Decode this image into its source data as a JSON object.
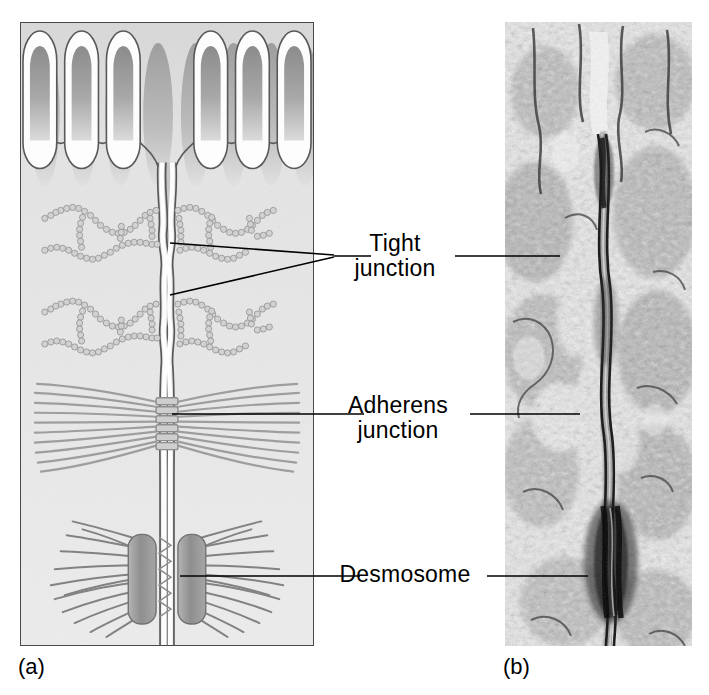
{
  "figure": {
    "panels": [
      {
        "id": "a",
        "caption": "(a)",
        "kind": "schematic-diagram"
      },
      {
        "id": "b",
        "caption": "(b)",
        "kind": "transmission-electron-micrograph"
      }
    ]
  },
  "labels": {
    "tight_junction": "Tight\njunction",
    "adherens_junction": "Adherens\njunction",
    "desmosome": "Desmosome"
  },
  "captions": {
    "panel_a": "(a)",
    "panel_b": "(b)"
  },
  "structures": [
    {
      "name": "microvilli",
      "count": 6,
      "panel": "a"
    },
    {
      "name": "plasma-membrane",
      "panel": "a"
    },
    {
      "name": "intercellular-cleft",
      "panel": "a"
    },
    {
      "name": "tight-junction-strands",
      "panel": "a",
      "instances": 2
    },
    {
      "name": "adherens-junction-actin-belt",
      "panel": "a"
    },
    {
      "name": "desmosome-plaque",
      "panel": "a",
      "instances": 2
    },
    {
      "name": "intermediate-filaments",
      "panel": "a"
    }
  ],
  "colors": {
    "panel_background": "#eaeaea",
    "panel_border": "#4a4a4a",
    "membrane_outline": "#555555",
    "membrane_fill": "#ffffff",
    "microvillus_core": "#8f8f8f",
    "strand_bead": "#c9c9c9",
    "filament": "#9a9a9a",
    "plaque": "#8a8a8a",
    "leader_line": "#000000",
    "label_text": "#000000",
    "micrograph_dark": "#2b2b2b",
    "micrograph_light": "#f2f2f2"
  },
  "leader_lines": [
    {
      "for": "tight_junction",
      "style": "converging-pair-left"
    },
    {
      "for": "tight_junction",
      "style": "straight-right"
    },
    {
      "for": "adherens_junction",
      "style": "straight-left"
    },
    {
      "for": "adherens_junction",
      "style": "straight-right"
    },
    {
      "for": "desmosome",
      "style": "straight-left"
    },
    {
      "for": "desmosome",
      "style": "straight-right"
    }
  ]
}
